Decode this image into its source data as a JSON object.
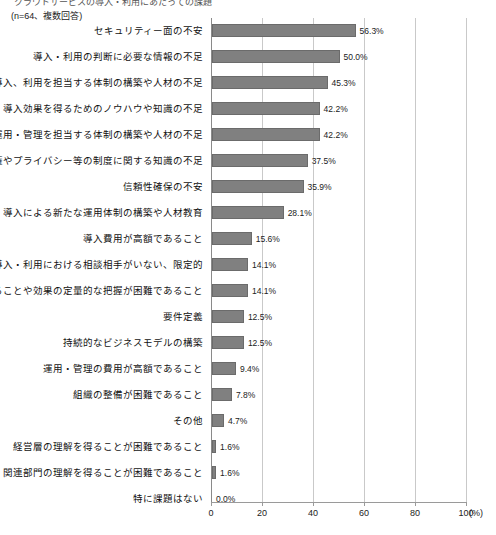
{
  "header": {
    "title_cropped": "クラウドサービスの導入・利用にあたっての課題",
    "subtitle": "(n=64、複数回答)"
  },
  "axis": {
    "unit": "(%)",
    "ticks": [
      "0",
      "20",
      "40",
      "60",
      "80",
      "100"
    ]
  },
  "chart_data": {
    "type": "bar",
    "orientation": "horizontal",
    "title": "クラウドサービスの導入・利用にあたっての課題",
    "subtitle": "(n=64、複数回答)",
    "xlabel": "(%)",
    "ylabel": "",
    "xlim": [
      0,
      100
    ],
    "xticks": [
      0,
      20,
      40,
      60,
      80,
      100
    ],
    "grid": true,
    "legend": "none",
    "bar_color": "#808080",
    "bar_border_color": "#6b6b6b",
    "gridline_color": "#c9c9c9",
    "categories": [
      "セキュリティー面の不安",
      "導入・利用の判断に必要な情報の不足",
      "導入、利用を担当する体制の構築や人材の不足",
      "導入効果を得るためのノウハウや知識の不足",
      "運用・管理を担当する体制の構築や人材の不足",
      "著作権やプライバシー等の制度に関する知識の不足",
      "信頼性確保の不安",
      "導入による新たな運用体制の構築や人材教育",
      "導入費用が高額であること",
      "導入・利用における相談相手がいない、限定的",
      "導入効果を得ることや効果の定量的な把握が困難であること",
      "要件定義",
      "持続的なビジネスモデルの構築",
      "運用・管理の費用が高額であること",
      "組織の整備が困難であること",
      "その他",
      "経営層の理解を得ることが困難であること",
      "関連部門の理解を得ることが困難であること",
      "特に課題はない"
    ],
    "values": [
      56.3,
      50.0,
      45.3,
      42.2,
      42.2,
      37.5,
      35.9,
      28.1,
      15.6,
      14.1,
      14.1,
      12.5,
      12.5,
      9.4,
      7.8,
      4.7,
      1.6,
      1.6,
      0.0
    ],
    "value_labels": [
      "56.3%",
      "50.0%",
      "45.3%",
      "42.2%",
      "42.2%",
      "37.5%",
      "35.9%",
      "28.1%",
      "15.6%",
      "14.1%",
      "14.1%",
      "12.5%",
      "12.5%",
      "9.4%",
      "7.8%",
      "4.7%",
      "1.6%",
      "1.6%",
      "0.0%"
    ]
  }
}
